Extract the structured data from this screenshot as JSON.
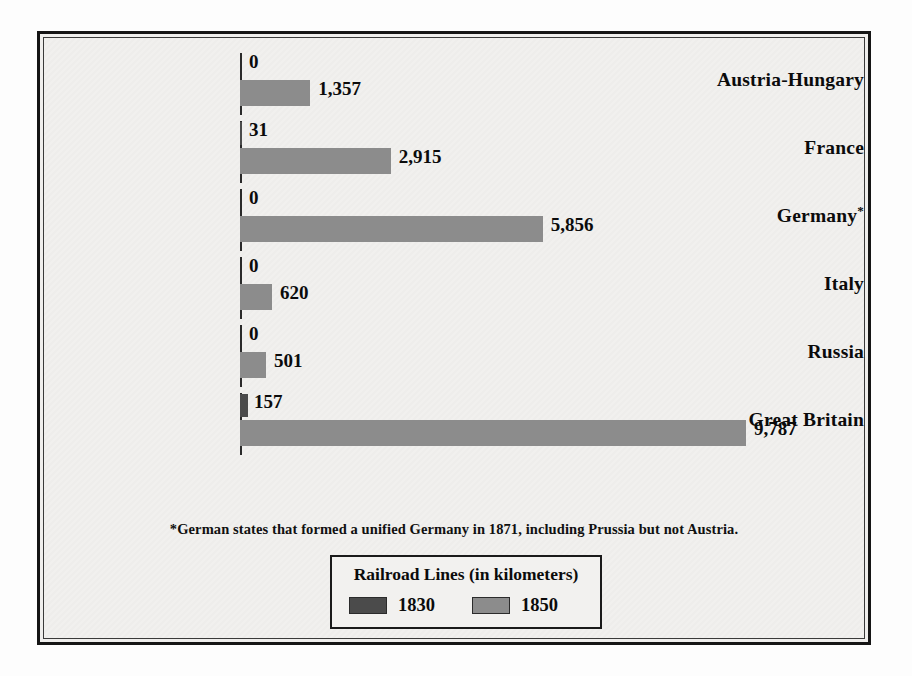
{
  "chart_data": {
    "type": "bar",
    "orientation": "horizontal",
    "title": "Railroad Lines (in kilometers)",
    "xlabel": "",
    "ylabel": "",
    "grid": false,
    "legend_position": "bottom-center",
    "categories": [
      "Austria-Hungary",
      "France",
      "Germany*",
      "Italy",
      "Russia",
      "Great Britain"
    ],
    "series": [
      {
        "name": "1830",
        "color": "#4b4b4b",
        "values": [
          0,
          31,
          0,
          0,
          0,
          157
        ],
        "labels": [
          "0",
          "31",
          "0",
          "0",
          "0",
          "157"
        ]
      },
      {
        "name": "1850",
        "color": "#8c8c8c",
        "values": [
          1357,
          2915,
          5856,
          620,
          501,
          9787
        ],
        "labels": [
          "1,357",
          "2,915",
          "5,856",
          "620",
          "501",
          "9,787"
        ]
      }
    ],
    "xlim": [
      0,
      9787
    ],
    "footnote": "*German states that formed a unified Germany in 1871, including Prussia but not Austria."
  },
  "rows": [
    {
      "label": "Austria-Hungary",
      "star": "",
      "v1830": 0,
      "l1830": "0",
      "v1850": 1357,
      "l1850": "1,357"
    },
    {
      "label": "France",
      "star": "",
      "v1830": 31,
      "l1830": "31",
      "v1850": 2915,
      "l1850": "2,915"
    },
    {
      "label": "Germany",
      "star": "*",
      "v1830": 0,
      "l1830": "0",
      "v1850": 5856,
      "l1850": "5,856"
    },
    {
      "label": "Italy",
      "star": "",
      "v1830": 0,
      "l1830": "0",
      "v1850": 620,
      "l1850": "620"
    },
    {
      "label": "Russia",
      "star": "",
      "v1830": 0,
      "l1830": "0",
      "v1850": 501,
      "l1850": "501"
    },
    {
      "label": "Great Britain",
      "star": "",
      "v1830": 157,
      "l1830": "157",
      "v1850": 9787,
      "l1850": "9,787"
    }
  ],
  "footnote": {
    "text": "*German states that formed a unified Germany in 1871, including Prussia but not Austria."
  },
  "legend": {
    "title": "Railroad Lines (in kilometers)",
    "entries": [
      {
        "label": "1830",
        "color": "#4b4b4b"
      },
      {
        "label": "1850",
        "color": "#8c8c8c"
      }
    ]
  },
  "colors": {
    "series_1830": "#4b4b4b",
    "series_1850": "#8c8c8c",
    "frame": "#151515",
    "background": "#f1f0ee",
    "text": "#0b0b0b"
  }
}
